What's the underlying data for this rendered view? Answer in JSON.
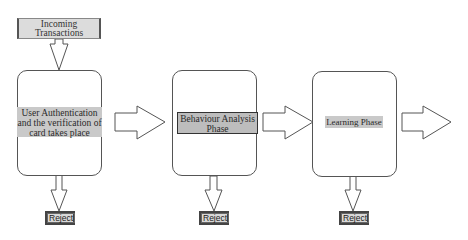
{
  "diagram": {
    "type": "flowchart",
    "input": {
      "label": "Incoming Transactions"
    },
    "stages": [
      {
        "id": "auth",
        "label": "User Authentication and the verification of card takes place",
        "reject_label": "Reject"
      },
      {
        "id": "behaviour",
        "label": "Behaviour Analysis Phase",
        "reject_label": "Reject"
      },
      {
        "id": "learning",
        "label": "Learning Phase",
        "reject_label": "Reject"
      }
    ],
    "edges": [
      {
        "from": "Incoming Transactions",
        "to": "auth"
      },
      {
        "from": "auth",
        "to": "behaviour"
      },
      {
        "from": "behaviour",
        "to": "learning"
      },
      {
        "from": "learning",
        "to": "(next)"
      },
      {
        "from": "auth",
        "to": "Reject"
      },
      {
        "from": "behaviour",
        "to": "Reject"
      },
      {
        "from": "learning",
        "to": "Reject"
      }
    ],
    "colors": {
      "stroke": "#555555",
      "label_highlight": "#c9c9c9",
      "reject_fill": "#d8d8d8"
    }
  }
}
